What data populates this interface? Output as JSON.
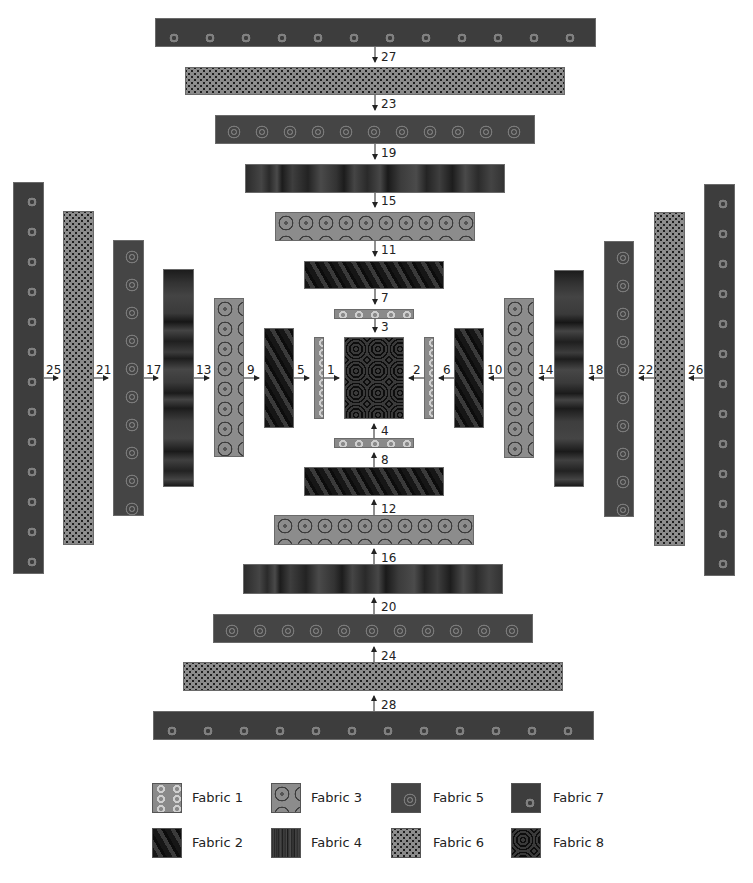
{
  "diagram": {
    "type": "quilt-assembly",
    "center_block": {
      "fabric": "Fabric 8"
    },
    "strips": [
      {
        "n": "1",
        "fabric": "Fabric 1",
        "side": "left"
      },
      {
        "n": "2",
        "fabric": "Fabric 1",
        "side": "right"
      },
      {
        "n": "3",
        "fabric": "Fabric 1",
        "side": "top"
      },
      {
        "n": "4",
        "fabric": "Fabric 1",
        "side": "bottom"
      },
      {
        "n": "5",
        "fabric": "Fabric 2",
        "side": "left"
      },
      {
        "n": "6",
        "fabric": "Fabric 2",
        "side": "right"
      },
      {
        "n": "7",
        "fabric": "Fabric 2",
        "side": "top"
      },
      {
        "n": "8",
        "fabric": "Fabric 2",
        "side": "bottom"
      },
      {
        "n": "9",
        "fabric": "Fabric 3",
        "side": "left"
      },
      {
        "n": "10",
        "fabric": "Fabric 3",
        "side": "right"
      },
      {
        "n": "11",
        "fabric": "Fabric 3",
        "side": "top"
      },
      {
        "n": "12",
        "fabric": "Fabric 3",
        "side": "bottom"
      },
      {
        "n": "13",
        "fabric": "Fabric 4",
        "side": "left"
      },
      {
        "n": "14",
        "fabric": "Fabric 4",
        "side": "right"
      },
      {
        "n": "15",
        "fabric": "Fabric 4",
        "side": "top"
      },
      {
        "n": "16",
        "fabric": "Fabric 4",
        "side": "bottom"
      },
      {
        "n": "17",
        "fabric": "Fabric 5",
        "side": "left"
      },
      {
        "n": "18",
        "fabric": "Fabric 5",
        "side": "right"
      },
      {
        "n": "19",
        "fabric": "Fabric 5",
        "side": "top"
      },
      {
        "n": "20",
        "fabric": "Fabric 5",
        "side": "bottom"
      },
      {
        "n": "21",
        "fabric": "Fabric 6",
        "side": "left"
      },
      {
        "n": "22",
        "fabric": "Fabric 6",
        "side": "right"
      },
      {
        "n": "23",
        "fabric": "Fabric 6",
        "side": "top"
      },
      {
        "n": "24",
        "fabric": "Fabric 6",
        "side": "bottom"
      },
      {
        "n": "25",
        "fabric": "Fabric 7",
        "side": "left"
      },
      {
        "n": "26",
        "fabric": "Fabric 7",
        "side": "right"
      },
      {
        "n": "27",
        "fabric": "Fabric 7",
        "side": "top"
      },
      {
        "n": "28",
        "fabric": "Fabric 7",
        "side": "bottom"
      }
    ]
  },
  "legend": {
    "items": [
      {
        "label": "Fabric 1"
      },
      {
        "label": "Fabric 2"
      },
      {
        "label": "Fabric 3"
      },
      {
        "label": "Fabric 4"
      },
      {
        "label": "Fabric 5"
      },
      {
        "label": "Fabric 6"
      },
      {
        "label": "Fabric 7"
      },
      {
        "label": "Fabric 8"
      }
    ]
  }
}
